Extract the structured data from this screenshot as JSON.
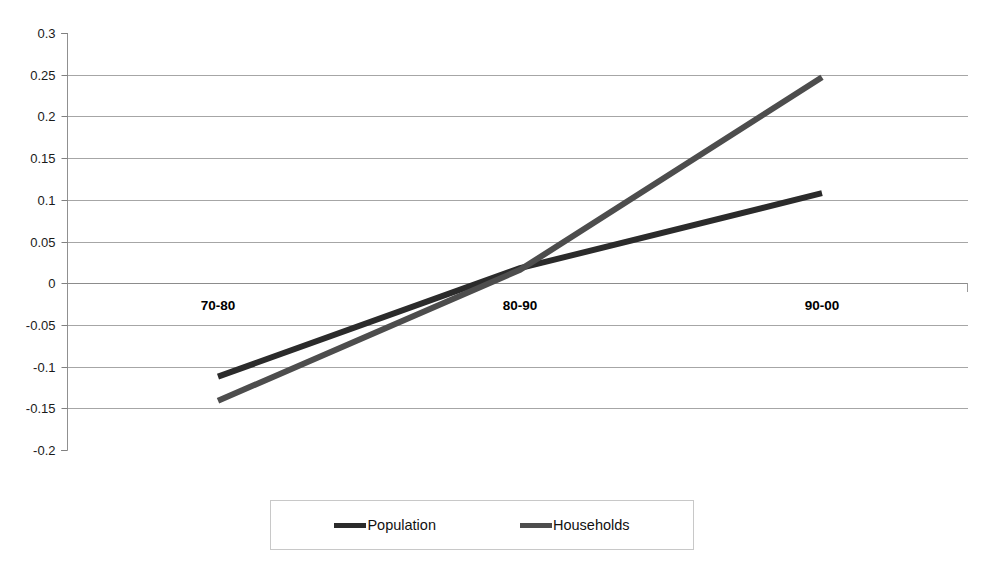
{
  "chart_data": {
    "type": "line",
    "title": "",
    "subtitle": "",
    "xlabel": "",
    "ylabel": "",
    "categories": [
      "70-80",
      "80-90",
      "90-00"
    ],
    "series": [
      {
        "name": "Population",
        "color": "#2b2b2b",
        "values": [
          -0.112,
          0.018,
          0.108
        ]
      },
      {
        "name": "Households",
        "color": "#4d4d4d",
        "values": [
          -0.141,
          0.016,
          0.247
        ]
      }
    ],
    "ylim": [
      -0.2,
      0.3
    ],
    "ytick_step": 0.05,
    "ytick_labels": [
      "0.3",
      "0.25",
      "0.2",
      "0.15",
      "0.1",
      "0.05",
      "0",
      "-0.05",
      "-0.1",
      "-0.15",
      "-0.2"
    ],
    "ytick_values": [
      0.3,
      0.25,
      0.2,
      0.15,
      0.1,
      0.05,
      0,
      -0.05,
      -0.1,
      -0.15,
      -0.2
    ],
    "grid": true,
    "grid_color": "#a6a6a6",
    "axis_color": "#808080",
    "legend_position": "bottom",
    "plot_background": "#ffffff"
  },
  "legend": {
    "entries": [
      {
        "label": "Population"
      },
      {
        "label": "Households"
      }
    ]
  }
}
